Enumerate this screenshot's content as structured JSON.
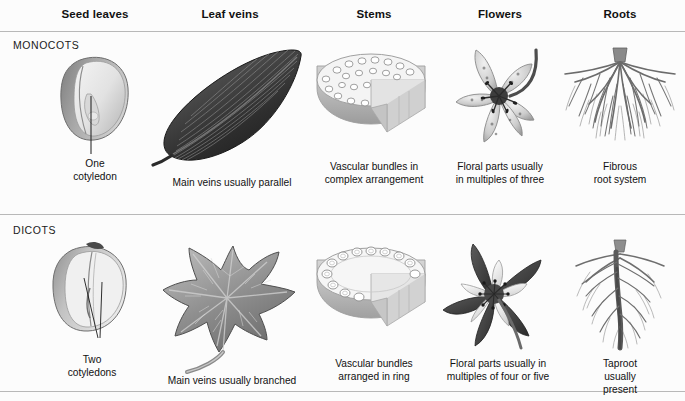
{
  "figure": {
    "columns": [
      {
        "id": "seed-leaves",
        "label": "Seed leaves",
        "x": 95
      },
      {
        "id": "leaf-veins",
        "label": "Leaf veins",
        "x": 230
      },
      {
        "id": "stems",
        "label": "Stems",
        "x": 374
      },
      {
        "id": "flowers",
        "label": "Flowers",
        "x": 500
      },
      {
        "id": "roots",
        "label": "Roots",
        "x": 620
      }
    ],
    "rows": [
      {
        "id": "monocots",
        "label": "MONOCOTS"
      },
      {
        "id": "dicots",
        "label": "DICOTS"
      }
    ],
    "cells": {
      "monocots": {
        "seed_leaves": "One\ncotyledon",
        "leaf_veins": "Main veins usually parallel",
        "stems": "Vascular bundles in\ncomplex arrangement",
        "flowers": "Floral parts usually\nin multiples of three",
        "roots": "Fibrous\nroot system"
      },
      "dicots": {
        "seed_leaves": "Two\ncotyledons",
        "leaf_veins": "Main veins usually branched",
        "stems": "Vascular bundles\narranged in ring",
        "flowers": "Floral parts usually in\nmultiples of four or five",
        "roots": "Taproot\nusually present"
      }
    },
    "colors": {
      "background": "#fcfcfc",
      "text": "#111111",
      "divider": "#b8b8b8",
      "illustration_dark": "#3a3a3a",
      "illustration_mid": "#8a8a8a",
      "illustration_light": "#d4d4d4"
    },
    "illustrations": {
      "monocot_seed": "monocot-seed-illustration",
      "monocot_leaf": "monocot-leaf-illustration",
      "monocot_stem": "monocot-stem-cross-section-illustration",
      "monocot_flower": "monocot-flower-illustration",
      "monocot_roots": "fibrous-root-system-illustration",
      "dicot_seed": "dicot-seed-illustration",
      "dicot_leaf": "dicot-leaf-illustration",
      "dicot_stem": "dicot-stem-cross-section-illustration",
      "dicot_flower": "dicot-flower-illustration",
      "dicot_roots": "taproot-system-illustration"
    }
  }
}
